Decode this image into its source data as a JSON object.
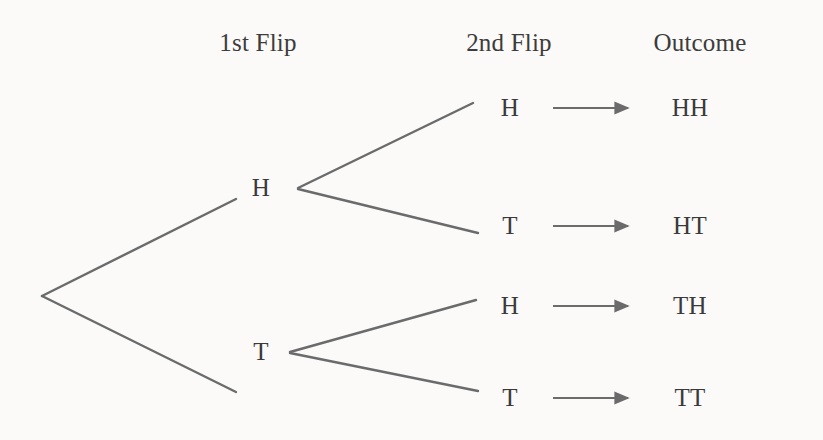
{
  "figure": {
    "background_color": "#fbfaf9",
    "line_color": "#6b6b6b",
    "text_color": "#3a3a3a"
  },
  "headers": [
    {
      "label": "1st Flip",
      "x": 258,
      "y": 43
    },
    {
      "label": "2nd Flip",
      "x": 509,
      "y": 43
    },
    {
      "label": "Outcome",
      "x": 700,
      "y": 43
    }
  ],
  "first_flip_nodes": [
    {
      "label": "H",
      "x": 261,
      "y": 188
    },
    {
      "label": "T",
      "x": 261,
      "y": 352
    }
  ],
  "second_flip_nodes": [
    {
      "label": "H",
      "x": 510,
      "y": 108,
      "parent": "H"
    },
    {
      "label": "T",
      "x": 510,
      "y": 226,
      "parent": "H"
    },
    {
      "label": "H",
      "x": 510,
      "y": 306,
      "parent": "T"
    },
    {
      "label": "T",
      "x": 510,
      "y": 398,
      "parent": "T"
    }
  ],
  "outcomes": [
    {
      "label": "HH",
      "x": 690,
      "y": 108
    },
    {
      "label": "HT",
      "x": 690,
      "y": 226
    },
    {
      "label": "TH",
      "x": 690,
      "y": 306
    },
    {
      "label": "TT",
      "x": 690,
      "y": 398
    }
  ],
  "branches": [
    {
      "name": "root-to-H",
      "x1": 42,
      "y1": 296,
      "x2": 236,
      "y2": 199
    },
    {
      "name": "root-to-T",
      "x1": 42,
      "y1": 296,
      "x2": 236,
      "y2": 392
    },
    {
      "name": "H-to-H",
      "x1": 298,
      "y1": 188,
      "x2": 473,
      "y2": 103
    },
    {
      "name": "H-to-T",
      "x1": 298,
      "y1": 189,
      "x2": 478,
      "y2": 233
    },
    {
      "name": "T-to-H",
      "x1": 290,
      "y1": 352,
      "x2": 476,
      "y2": 300
    },
    {
      "name": "T-to-T",
      "x1": 290,
      "y1": 353,
      "x2": 478,
      "y2": 391
    }
  ],
  "arrows": [
    {
      "name": "arrow-to-HH",
      "x1": 553,
      "y1": 108,
      "x2": 628,
      "y2": 108
    },
    {
      "name": "arrow-to-HT",
      "x1": 553,
      "y1": 226,
      "x2": 628,
      "y2": 226
    },
    {
      "name": "arrow-to-TH",
      "x1": 553,
      "y1": 306,
      "x2": 628,
      "y2": 306
    },
    {
      "name": "arrow-to-TT",
      "x1": 553,
      "y1": 398,
      "x2": 628,
      "y2": 398
    }
  ]
}
